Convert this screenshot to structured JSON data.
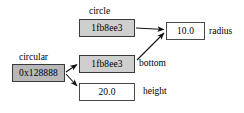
{
  "diagram": {
    "background_color": "#ffffff",
    "boxes": [
      {
        "id": "circular",
        "value": "0x128888",
        "caption": "circular",
        "fill": "#b8b8b8",
        "style": "filled-dark"
      },
      {
        "id": "circle_ref",
        "value": "1fb8ee3",
        "caption": "circle",
        "fill": "#cfcfcf",
        "style": "filled-light"
      },
      {
        "id": "bottom_ref",
        "value": "1fb8ee3",
        "caption": "bottom",
        "fill": "#cfcfcf",
        "style": "filled-light"
      },
      {
        "id": "height_val",
        "value": "20.0",
        "caption": "height",
        "fill": "#ffffff",
        "style": "plain"
      },
      {
        "id": "radius_val",
        "value": "10.0",
        "caption": "radius",
        "fill": "#ffffff",
        "style": "plain"
      }
    ],
    "captions": {
      "circular": "circular",
      "circle": "circle"
    },
    "side_labels": {
      "radius": "radius",
      "bottom": "bottom",
      "height": "height"
    },
    "arrows": [
      {
        "from": "circular",
        "to": "bottom_ref",
        "kind": "reference"
      },
      {
        "from": "circular",
        "to": "height_val",
        "kind": "reference"
      },
      {
        "from": "circle_ref",
        "to": "radius_val",
        "kind": "reference"
      },
      {
        "from": "bottom_ref",
        "to": "radius_val",
        "kind": "reference"
      }
    ]
  }
}
